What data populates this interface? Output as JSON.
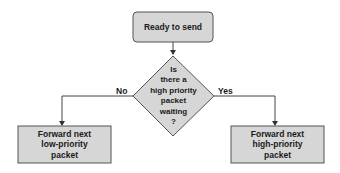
{
  "diagram": {
    "colors": {
      "fill": "#d6d6d6",
      "stroke": "#555555",
      "line": "#444444",
      "text": "#1a1a1a"
    },
    "nodes": {
      "start": {
        "label": "Ready to send",
        "shape": "rounded-rectangle"
      },
      "decision": {
        "label": "Is\nthere a\nhigh priority\npacket\nwaiting\n?",
        "shape": "diamond"
      },
      "low": {
        "label": "Forward next\nlow-priority\npacket",
        "shape": "rectangle"
      },
      "high": {
        "label": "Forward next\nhigh-priority\npacket",
        "shape": "rectangle"
      }
    },
    "edges": {
      "start_to_decision": {
        "label": ""
      },
      "no": {
        "label": "No"
      },
      "yes": {
        "label": "Yes"
      }
    }
  }
}
